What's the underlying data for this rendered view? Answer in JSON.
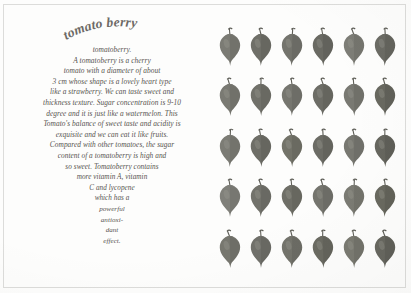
{
  "page": {
    "background_color": "#fdfdfc",
    "frame_color": "#dcdcda"
  },
  "logo": {
    "text": "tomato berry",
    "style": "curved-script",
    "color": "#6d6a66"
  },
  "article": {
    "lines": [
      "tomatoberry.",
      "A tomatoberry is a cherry",
      "tomato with a diameter of about",
      "3 cm whose shape is a lovely heart type",
      "like a strawberry. We can taste sweet and",
      "thickness texture. Sugar concentration is 9-10",
      "degree and it is just like a watermelon. This",
      "Tomato's balance of sweet taste and acidity is",
      "exquisite and we can eat it like fruits.",
      "Compared with other tomatoes, the sugar",
      "content of a tomatoberry is high and",
      "so sweet. Tomatoberry contains",
      "more vitamin A, vitamin",
      "C and lycopene",
      "which has a",
      "powerful",
      "antioxi-",
      "dant",
      "effect."
    ],
    "text_color": "#56534f"
  },
  "grid": {
    "columns": 6,
    "rows": 5,
    "count": 30,
    "item_label": "tomatoberry-fruit",
    "fruit_colors": [
      "#7b7b74",
      "#6f6f68",
      "#74746d",
      "#6a6a63",
      "#7d7d76",
      "#6b6b64",
      "#7a7a73",
      "#71716a",
      "#76766f",
      "#6d6d66",
      "#797972",
      "#68685f",
      "#7c7c75",
      "#6e6e67",
      "#737369",
      "#6c6c65",
      "#787871",
      "#66665e",
      "#80807a",
      "#72726b",
      "#6f6f67",
      "#75756e",
      "#7b7b73",
      "#69695f",
      "#77776f",
      "#70706a",
      "#74746c",
      "#6b6b62",
      "#7a7a71",
      "#67675f"
    ],
    "stem_color": "#5e5e57",
    "highlight_color": "#9a9a93"
  }
}
